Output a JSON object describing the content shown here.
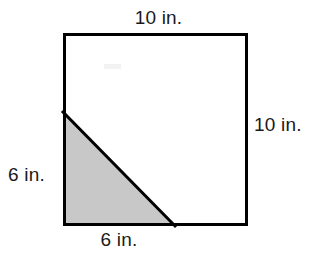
{
  "figure": {
    "shapes": {
      "square": {
        "name": "outer-square",
        "x": 63,
        "y": 33,
        "width": 185,
        "height": 193,
        "stroke_color": "#000000",
        "stroke_width": 3,
        "fill_color": "#ffffff"
      },
      "triangle": {
        "name": "shaded-triangle",
        "points": "63,112 63,226 175,226",
        "fill_color": "#c8c8c8",
        "stroke_color": "#000000",
        "stroke_width": 3
      }
    },
    "labels": {
      "top": "10 in.",
      "right": "10 in.",
      "left": "6 in.",
      "bottom": "6 in."
    },
    "artifact": {
      "name": "faint-smudge",
      "x": 104,
      "y": 64,
      "width": 17,
      "height": 5,
      "color": "#f2f2f2"
    }
  }
}
